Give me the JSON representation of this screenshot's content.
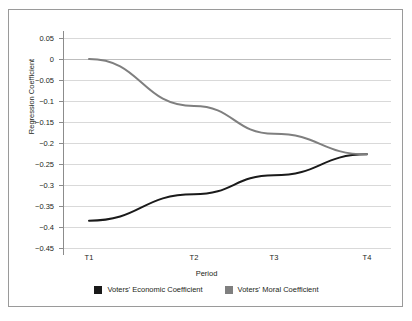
{
  "chart_data": {
    "type": "line",
    "title": "",
    "xlabel": "Period",
    "ylabel": "Regression Coefficient",
    "categories": [
      "T1",
      "T2",
      "T3",
      "T4"
    ],
    "ylim": [
      -0.45,
      0.05
    ],
    "yticks": [
      0.05,
      0,
      -0.05,
      -0.1,
      -0.15,
      -0.2,
      -0.25,
      -0.3,
      -0.35,
      -0.4,
      -0.45
    ],
    "ytick_labels": [
      "0.05",
      "0",
      "−0.05",
      "−0.1",
      "−0.15",
      "−0.2",
      "−0.25",
      "−0.3",
      "−0.35",
      "−0.4",
      "−0.45"
    ],
    "grid": true,
    "legend_position": "bottom",
    "series": [
      {
        "name": "Voters' Economic Coefficient",
        "color": "#1a1a1a",
        "values": [
          -0.385,
          -0.322,
          -0.277,
          -0.227
        ]
      },
      {
        "name": "Voters' Moral Coefficient",
        "color": "#7f7f7f",
        "values": [
          0,
          -0.112,
          -0.178,
          -0.227
        ]
      }
    ]
  },
  "legend": {
    "entries": [
      {
        "label": "Voters' Economic Coefficient",
        "color": "#1a1a1a"
      },
      {
        "label": "Voters' Moral Coefficient",
        "color": "#7f7f7f"
      }
    ]
  },
  "colors": {
    "economic": "#1a1a1a",
    "moral": "#7f7f7f",
    "grid": "#d9d9d9",
    "axis": "#8c8c8c",
    "border": "#9a9a9a",
    "text": "#231f20"
  }
}
